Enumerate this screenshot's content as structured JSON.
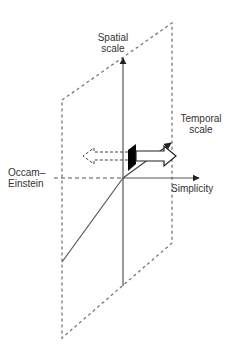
{
  "diagram": {
    "type": "3d-axes",
    "axes": {
      "vertical": {
        "label_lines": [
          "Spatial",
          "scale"
        ]
      },
      "depth": {
        "label_lines": [
          "Temporal",
          "scale"
        ]
      },
      "horizontal_positive": {
        "label": "Simplicity"
      },
      "horizontal_negative": {
        "label_lines": [
          "Occam–",
          "Einstein"
        ]
      }
    },
    "plane": {
      "style": "dashed parallelogram"
    },
    "arrows": [
      {
        "name": "solid-open-arrow",
        "direction": "right",
        "style": "white fill, black outline"
      },
      {
        "name": "dashed-open-arrow",
        "direction": "left",
        "style": "dashed outline"
      }
    ],
    "marker": {
      "name": "black-plane-section",
      "color": "#000000"
    }
  },
  "colors": {
    "axis": "#555555",
    "dashed": "#777777",
    "marker": "#000000"
  }
}
